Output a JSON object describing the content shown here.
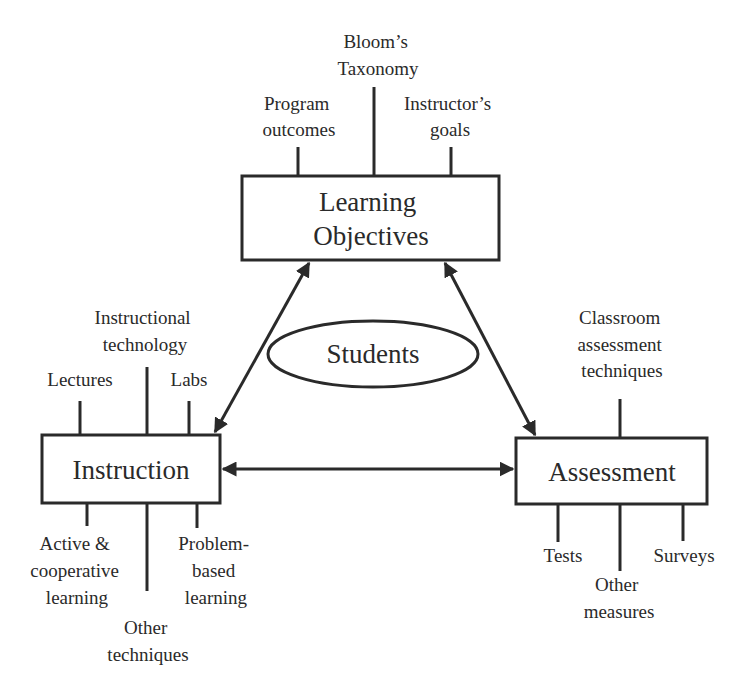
{
  "diagram": {
    "nodes": {
      "learning_objectives": {
        "line1": "Learning",
        "line2": "Objectives"
      },
      "instruction": {
        "label": "Instruction"
      },
      "assessment": {
        "label": "Assessment"
      },
      "students": {
        "label": "Students"
      }
    },
    "learning_objectives_inputs": {
      "program_outcomes": {
        "line1": "Program",
        "line2": "outcomes"
      },
      "blooms_taxonomy": {
        "line1": "Bloom’s",
        "line2": "Taxonomy"
      },
      "instructors_goals": {
        "line1": "Instructor’s",
        "line2": "goals"
      }
    },
    "instruction_inputs": {
      "lectures": {
        "line1": "Lectures"
      },
      "instructional_technology": {
        "line1": "Instructional",
        "line2": "technology"
      },
      "labs": {
        "line1": "Labs"
      },
      "active_cooperative": {
        "line1": "Active &",
        "line2": "cooperative",
        "line3": "learning"
      },
      "other_techniques": {
        "line1": "Other",
        "line2": "techniques"
      },
      "problem_based": {
        "line1": "Problem-",
        "line2": "based",
        "line3": "learning"
      }
    },
    "assessment_inputs": {
      "classroom_assessment": {
        "line1": "Classroom",
        "line2": "assessment",
        "line3": "techniques"
      },
      "tests": {
        "line1": "Tests"
      },
      "other_measures": {
        "line1": "Other",
        "line2": "measures"
      },
      "surveys": {
        "line1": "Surveys"
      }
    },
    "connections": [
      {
        "from": "Learning Objectives",
        "to": "Instruction",
        "type": "bidirectional"
      },
      {
        "from": "Learning Objectives",
        "to": "Assessment",
        "type": "bidirectional"
      },
      {
        "from": "Instruction",
        "to": "Assessment",
        "type": "bidirectional"
      }
    ]
  }
}
